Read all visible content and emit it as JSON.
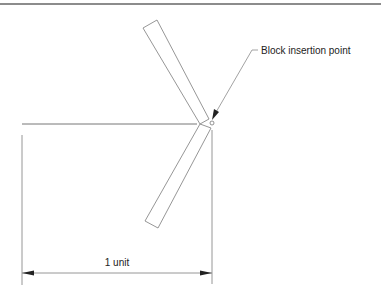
{
  "diagram": {
    "labels": {
      "insertion_point": "Block insertion point",
      "dimension": "1 unit"
    },
    "colors": {
      "line": "#8a8a8a",
      "rule": "#666666",
      "text": "#222222",
      "arrow": "#222222"
    }
  }
}
